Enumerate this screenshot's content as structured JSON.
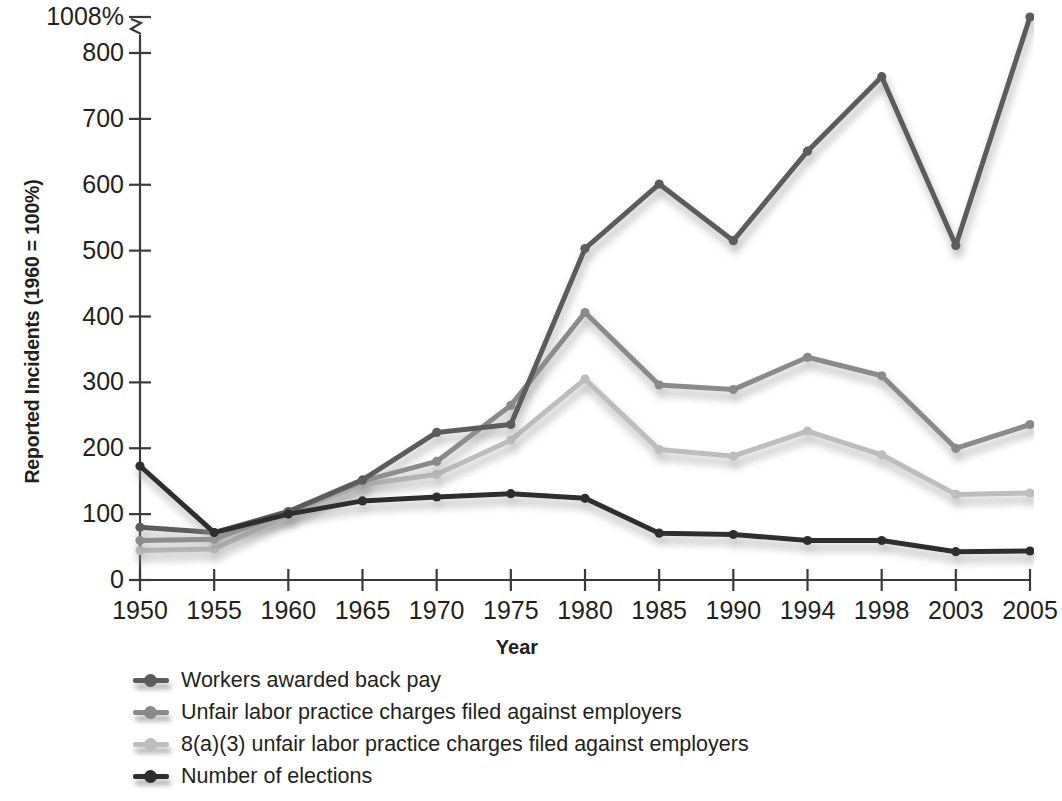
{
  "figure": {
    "cut_off_title": "employment discrimination charges",
    "y_axis_title": "Reported Incidents (1960 = 100%)",
    "x_axis_title": "Year",
    "y_tick_labels": [
      "0",
      "100",
      "200",
      "300",
      "400",
      "500",
      "600",
      "700",
      "800",
      "1008%"
    ],
    "x_tick_labels": [
      "1950",
      "1955",
      "1960",
      "1965",
      "1970",
      "1975",
      "1980",
      "1985",
      "1990",
      "1994",
      "1998",
      "2003",
      "2005"
    ],
    "axis_break": true
  },
  "legend": {
    "position": "below-axis-left",
    "items": [
      {
        "label": "Workers awarded back pay",
        "color": "#5b5b5b"
      },
      {
        "label": "Unfair labor practice charges filed against employers",
        "color": "#8a8a8a"
      },
      {
        "label": "8(a)(3) unfair labor practice charges filed against employers",
        "color": "#bdbdbd"
      },
      {
        "label": "Number of elections",
        "color": "#2e2e2e"
      }
    ]
  },
  "chart_data": {
    "type": "line",
    "title": "",
    "xlabel": "Year",
    "ylabel": "Reported Incidents (1960 = 100%)",
    "categories": [
      "1950",
      "1955",
      "1960",
      "1965",
      "1970",
      "1975",
      "1980",
      "1985",
      "1990",
      "1994",
      "1998",
      "2003",
      "2005"
    ],
    "ylim": [
      0,
      1008
    ],
    "y_ticks": [
      0,
      100,
      200,
      300,
      400,
      500,
      600,
      700,
      800,
      1008
    ],
    "axis_break_between": [
      800,
      1008
    ],
    "grid": false,
    "legend_position": "below",
    "series": [
      {
        "name": "Workers awarded back pay",
        "color": "#5b5b5b",
        "values": [
          80,
          72,
          104,
          152,
          224,
          236,
          503,
          601,
          515,
          651,
          764,
          508,
          1008
        ]
      },
      {
        "name": "Unfair labor practice charges filed against employers",
        "color": "#8a8a8a",
        "values": [
          60,
          62,
          103,
          150,
          180,
          265,
          406,
          296,
          289,
          338,
          310,
          200,
          236
        ]
      },
      {
        "name": "8(a)(3) unfair labor practice charges filed against employers",
        "color": "#bdbdbd",
        "values": [
          45,
          47,
          100,
          145,
          160,
          212,
          305,
          198,
          188,
          226,
          190,
          130,
          132
        ]
      },
      {
        "name": "Number of elections",
        "color": "#2e2e2e",
        "values": [
          173,
          72,
          100,
          120,
          126,
          131,
          124,
          71,
          69,
          60,
          60,
          43,
          44
        ]
      }
    ]
  }
}
